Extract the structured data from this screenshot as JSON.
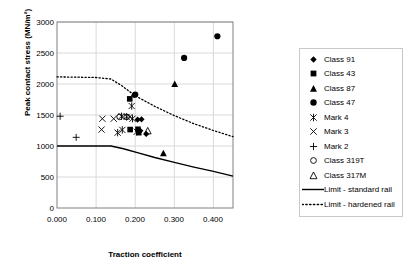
{
  "chart_data": {
    "type": "scatter",
    "title": "",
    "xlabel": "Traction coefficient",
    "ylabel": "Peak contact stress (MN/m²)",
    "xlim": [
      0.0,
      0.45
    ],
    "ylim": [
      0,
      3000
    ],
    "xticks": [
      "0.000",
      "0.100",
      "0.200",
      "0.300",
      "0.400"
    ],
    "xtick_values": [
      0.0,
      0.1,
      0.2,
      0.3,
      0.4
    ],
    "yticks": [
      "0",
      "500",
      "1000",
      "1500",
      "2000",
      "2500",
      "3000"
    ],
    "ytick_values": [
      0,
      500,
      1000,
      1500,
      2000,
      2500,
      3000
    ],
    "grid": "both-light",
    "legend_position": "right-outside",
    "series": [
      {
        "name": "Class 91",
        "marker": "diamond-filled",
        "points": [
          [
            0.197,
            1820
          ],
          [
            0.206,
            1425
          ],
          [
            0.216,
            1430
          ],
          [
            0.213,
            1245
          ],
          [
            0.228,
            1195
          ]
        ]
      },
      {
        "name": "Class 43",
        "marker": "square-filled",
        "points": [
          [
            0.186,
            1760
          ],
          [
            0.187,
            1265
          ],
          [
            0.207,
            1270
          ],
          [
            0.209,
            1215
          ]
        ]
      },
      {
        "name": "Class 87",
        "marker": "triangle-filled",
        "points": [
          [
            0.301,
            2000
          ],
          [
            0.272,
            885
          ]
        ]
      },
      {
        "name": "Class 47",
        "marker": "circle-filled",
        "points": [
          [
            0.41,
            2770
          ],
          [
            0.325,
            2420
          ],
          [
            0.2,
            1830
          ]
        ]
      },
      {
        "name": "Mark 4",
        "marker": "star",
        "points": [
          [
            0.165,
            1480
          ],
          [
            0.178,
            1470
          ],
          [
            0.193,
            1440
          ],
          [
            0.191,
            1645
          ],
          [
            0.167,
            1260
          ],
          [
            0.155,
            1215
          ],
          [
            0.204,
            1230
          ]
        ]
      },
      {
        "name": "Mark 3",
        "marker": "cross-x",
        "points": [
          [
            0.116,
            1440
          ],
          [
            0.114,
            1265
          ],
          [
            0.186,
            1470
          ],
          [
            0.145,
            1440
          ]
        ]
      },
      {
        "name": "Mark 2",
        "marker": "plus",
        "points": [
          [
            0.008,
            1480
          ],
          [
            0.049,
            1140
          ]
        ]
      },
      {
        "name": "Class 319T",
        "marker": "circle-open",
        "points": [
          [
            0.16,
            1470
          ],
          [
            0.178,
            1470
          ]
        ]
      },
      {
        "name": "Class 317M",
        "marker": "triangle-open",
        "points": [
          [
            0.232,
            1245
          ]
        ]
      },
      {
        "name": "Limit - standard rail",
        "marker": "line-solid",
        "points": [
          [
            0.0,
            1000
          ],
          [
            0.138,
            1000
          ],
          [
            0.17,
            955
          ],
          [
            0.21,
            885
          ],
          [
            0.25,
            815
          ],
          [
            0.3,
            735
          ],
          [
            0.35,
            660
          ],
          [
            0.4,
            590
          ],
          [
            0.45,
            515
          ]
        ]
      },
      {
        "name": "Limit - hardened rail",
        "marker": "line-dotted",
        "points": [
          [
            0.0,
            2115
          ],
          [
            0.1,
            2105
          ],
          [
            0.138,
            2080
          ],
          [
            0.165,
            1975
          ],
          [
            0.2,
            1810
          ],
          [
            0.25,
            1640
          ],
          [
            0.3,
            1490
          ],
          [
            0.35,
            1360
          ],
          [
            0.4,
            1250
          ],
          [
            0.45,
            1150
          ]
        ]
      }
    ]
  },
  "legend": {
    "items": [
      {
        "label": "Class 91",
        "marker": "diamond-filled"
      },
      {
        "label": "Class 43",
        "marker": "square-filled"
      },
      {
        "label": "Class 87",
        "marker": "triangle-filled"
      },
      {
        "label": "Class 47",
        "marker": "circle-filled"
      },
      {
        "label": "Mark 4",
        "marker": "star"
      },
      {
        "label": "Mark 3",
        "marker": "cross-x"
      },
      {
        "label": "Mark 2",
        "marker": "plus"
      },
      {
        "label": "Class 319T",
        "marker": "circle-open"
      },
      {
        "label": "Class 317M",
        "marker": "triangle-open"
      },
      {
        "label": "Limit - standard rail",
        "marker": "line-solid"
      },
      {
        "label": "Limit - hardened rail",
        "marker": "line-dotted"
      }
    ]
  },
  "colors": {
    "ink": "#000000",
    "grid": "#d9d9d9",
    "axis": "#808080",
    "legend_border": "#c8c8c8"
  }
}
